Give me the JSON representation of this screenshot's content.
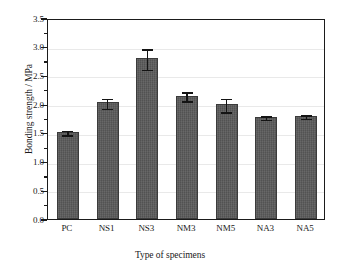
{
  "chart_data": {
    "type": "bar",
    "title": "",
    "xlabel": "Type of specimens",
    "ylabel": "Bonding strength / MPa",
    "categories": [
      "PC",
      "NS1",
      "NS3",
      "NM3",
      "NM5",
      "NA3",
      "NA5"
    ],
    "values": [
      1.52,
      2.03,
      2.8,
      2.15,
      2.0,
      1.78,
      1.8
    ],
    "errors": [
      0.05,
      0.1,
      0.19,
      0.09,
      0.13,
      0.04,
      0.04
    ],
    "ylim": [
      0.0,
      3.5
    ],
    "ytick_labels": [
      "0.0",
      "0.5",
      "1.0",
      "1.5",
      "2.0",
      "2.5",
      "3.0",
      "3.5"
    ],
    "ytick_values": [
      0.0,
      0.5,
      1.0,
      1.5,
      2.0,
      2.5,
      3.0,
      3.5
    ],
    "yminor_values": [
      0.25,
      0.75,
      1.25,
      1.75,
      2.25,
      2.75,
      3.25
    ],
    "grid": true,
    "legend": null,
    "series_name": "Bonding strength",
    "bar_color": "#5a5a5a",
    "bar_edge_color": "#3b3b3b",
    "error_color": "#141414",
    "grid_color": "#e9e9e9",
    "axis_color": "#1b1b1b",
    "background": "#ffffff"
  }
}
